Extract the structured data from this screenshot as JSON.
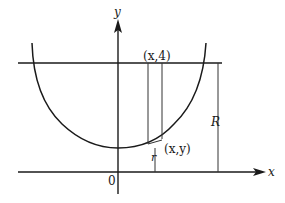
{
  "diagram": {
    "type": "coordinate-sketch",
    "colors": {
      "ink": "#1a1a1a",
      "thin": "#333333",
      "background": "#ffffff"
    },
    "axes": {
      "x_label": "x",
      "y_label": "y",
      "origin_label": "0"
    },
    "labels": {
      "top_point": "(x,4)",
      "curve_point": "(x,y)",
      "small_radius": "r",
      "large_radius": "R"
    },
    "elements": {
      "horizontal_line": "y = 4",
      "curve": "U-shaped curve symmetric about y-axis",
      "strip": "vertical strip from curve up to y = 4",
      "R_segment": "vertical segment from x-axis to line y = 4",
      "r_segment": "vertical segment from x-axis to curve"
    }
  }
}
